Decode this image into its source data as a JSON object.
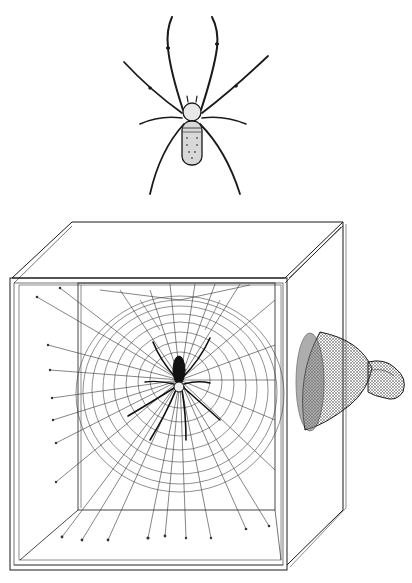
{
  "illustration": {
    "subject": "Orb-weaver spider and experimental web-building box with lamp",
    "colors": {
      "background": "#ffffff",
      "ink": "#1a1a1a",
      "web": "#333333",
      "shading": "#555555"
    },
    "figures": [
      {
        "id": "spider-top",
        "label": "spider dorsal view"
      },
      {
        "id": "box",
        "label": "open wooden frame box"
      },
      {
        "id": "web",
        "label": "orb web with spider at hub"
      },
      {
        "id": "lamp",
        "label": "lamp shining into box"
      }
    ],
    "caption": ""
  }
}
